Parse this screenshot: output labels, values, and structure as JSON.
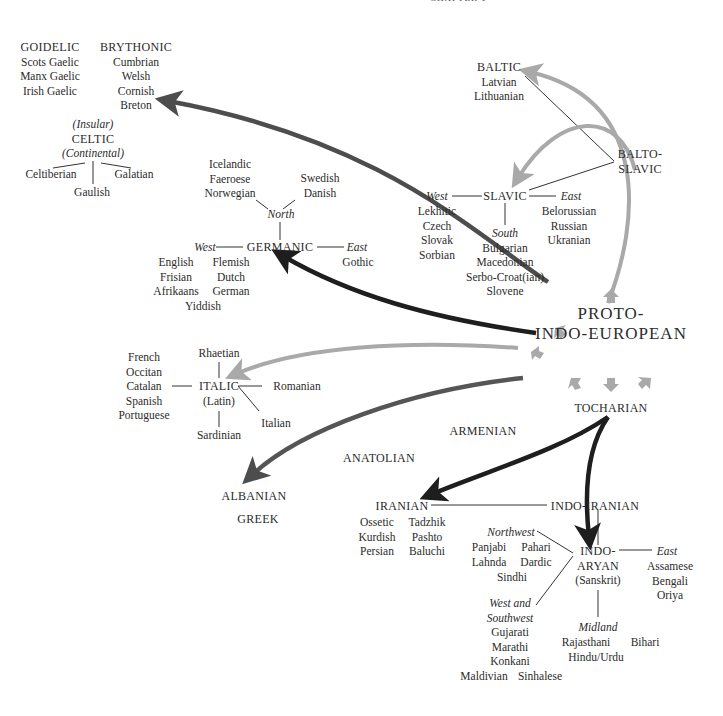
{
  "header": {
    "running_head": "CHAPTER 1"
  },
  "root": {
    "line1": "PROTO-",
    "line2": "INDO-EUROPEAN"
  },
  "colors": {
    "dark_arrow": "#1e1e1e",
    "mid_arrow": "#4d4d4d",
    "light_arrow": "#a9a9a9",
    "line": "#333333",
    "text": "#2b2b2b"
  },
  "celtic": {
    "goidelic": {
      "title": "GOIDELIC",
      "languages": [
        "Scots Gaelic",
        "Manx Gaelic",
        "Irish Gaelic"
      ]
    },
    "brythonic": {
      "title": "BRYTHONIC",
      "languages": [
        "Cumbrian",
        "Welsh",
        "Cornish",
        "Breton"
      ]
    },
    "insular": "(Insular)",
    "title": "CELTIC",
    "continental": "(Continental)",
    "continental_languages": [
      "Celtiberian",
      "Gaulish",
      "Galatian"
    ]
  },
  "germanic": {
    "title": "GERMANIC",
    "north": {
      "label": "North",
      "left": [
        "Icelandic",
        "Faeroese",
        "Norwegian"
      ],
      "right": [
        "Swedish",
        "Danish"
      ]
    },
    "west": {
      "label": "West",
      "left": [
        "English",
        "Frisian",
        "Afrikaans"
      ],
      "right": [
        "Flemish",
        "Dutch",
        "German"
      ],
      "bottom": "Yiddish"
    },
    "east": {
      "label": "East",
      "languages": [
        "Gothic"
      ]
    }
  },
  "balto_slavic": {
    "title_line1": "BALTO-",
    "title_line2": "SLAVIC",
    "baltic": {
      "title": "BALTIC",
      "languages": [
        "Latvian",
        "Lithuanian"
      ]
    },
    "slavic": {
      "title": "SLAVIC",
      "west": {
        "label": "West",
        "languages": [
          "Lekhitic",
          "Czech",
          "Slovak",
          "Sorbian"
        ]
      },
      "east": {
        "label": "East",
        "languages": [
          "Belorussian",
          "Russian",
          "Ukranian"
        ]
      },
      "south": {
        "label": "South",
        "languages": [
          "Bulgarian",
          "Macedonian",
          "Serbo-Croat(ian)",
          "Slovene"
        ]
      }
    }
  },
  "italic": {
    "title": "ITALIC",
    "subtitle": "(Latin)",
    "west_languages": [
      "French",
      "Occitan",
      "Catalan",
      "Spanish",
      "Portuguese"
    ],
    "north": "Rhaetian",
    "south": "Sardinian",
    "east": "Romanian",
    "southeast": "Italian"
  },
  "isolates": {
    "armenian": "ARMENIAN",
    "anatolian": "ANATOLIAN",
    "albanian": "ALBANIAN",
    "greek": "GREEK",
    "tocharian": "TOCHARIAN"
  },
  "indo_iranian": {
    "title": "INDO-IRANIAN",
    "iranian": {
      "title": "IRANIAN",
      "left": [
        "Ossetic",
        "Kurdish",
        "Persian"
      ],
      "right": [
        "Tadzhik",
        "Pashto",
        "Baluchi"
      ]
    },
    "indo_aryan": {
      "title_line1": "INDO-",
      "title_line2": "ARYAN",
      "subtitle": "(Sanskrit)",
      "northwest": {
        "label": "Northwest",
        "left": [
          "Panjabi",
          "Lahnda"
        ],
        "right": [
          "Pahari",
          "Dardic"
        ],
        "bottom": "Sindhi"
      },
      "west_southwest": {
        "label_line1": "West and",
        "label_line2": "Southwest",
        "languages": [
          "Gujarati",
          "Marathi",
          "Konkani"
        ],
        "bottom_left": "Maldivian",
        "bottom_right": "Sinhalese"
      },
      "east": {
        "label": "East",
        "languages": [
          "Assamese",
          "Bengali",
          "Oriya"
        ]
      },
      "midland": {
        "label": "Midland",
        "left": "Rajasthani",
        "right": "Bihari",
        "bottom": "Hindu/Urdu"
      }
    }
  }
}
